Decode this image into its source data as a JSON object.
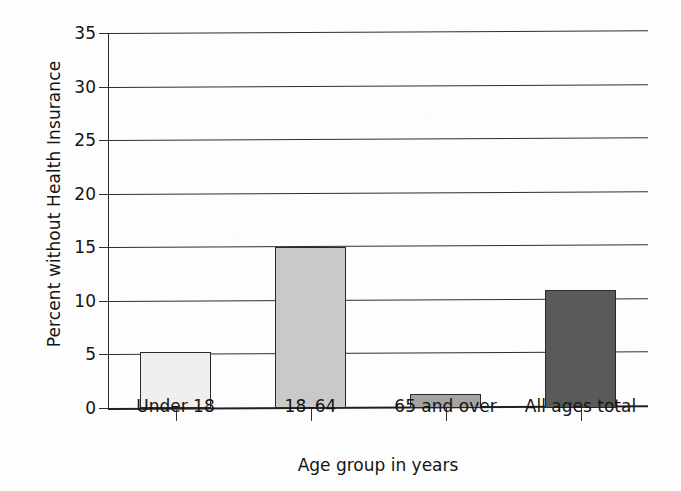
{
  "chart_data": {
    "type": "bar",
    "title": "",
    "subtitle": "",
    "xlabel": "Age group in years",
    "ylabel": "Percent without Health Insurance",
    "categories": [
      "Under 18",
      "18–64",
      "65 and over",
      "All ages total"
    ],
    "values": [
      5.2,
      15.0,
      1.3,
      11.0
    ],
    "series": [
      {
        "name": "Percent without Health Insurance",
        "values": [
          5.2,
          15.0,
          1.3,
          11.0
        ]
      }
    ],
    "bar_colors": [
      "#f0efed",
      "#c9c9c7",
      "#a3a3a1",
      "#5a5a58"
    ],
    "bar_edge_color": "#2a2a2a",
    "ylim": [
      0,
      35
    ],
    "ytick_step": 5,
    "yticks": [
      "0",
      "5",
      "10",
      "15",
      "20",
      "25",
      "30",
      "35"
    ],
    "xlim": [
      0,
      4
    ],
    "grid": "horizontal",
    "legend": "none",
    "axis_line_color": "#2e2e2e"
  },
  "figure": {
    "y_axis_title": "Percent without Health Insurance",
    "x_axis_title": "Age group in years"
  }
}
